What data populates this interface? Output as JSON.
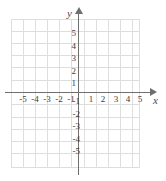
{
  "chart_data": {
    "type": "scatter",
    "title": "",
    "xlabel": "x",
    "ylabel": "y",
    "xlim": [
      -6,
      6
    ],
    "ylim": [
      -6,
      6
    ],
    "grid": true,
    "legend": null,
    "series": [],
    "x_ticks": [
      -5,
      -4,
      -3,
      -2,
      -1,
      1,
      2,
      3,
      4,
      5
    ],
    "y_ticks": [
      5,
      4,
      3,
      2,
      1,
      -1,
      -2,
      -3,
      -4,
      -5
    ],
    "x_tick_labels": [
      "-5",
      "-4",
      "-3",
      "-2",
      "-1",
      "1",
      "2",
      "3",
      "4",
      "5"
    ],
    "y_tick_labels": [
      "5",
      "4",
      "3",
      "2",
      "1",
      "-1",
      "-2",
      "-3",
      "-4",
      "-5"
    ],
    "annotations": [],
    "colors": {
      "background": "#ffffff",
      "grid": "#dedede",
      "axis": "#6f6f6f",
      "tick_text": "#3c3c3c",
      "axis_label_text": "#4a4a4a"
    }
  },
  "plane": {
    "axis_name_x": "x",
    "axis_name_y": "y",
    "x_labels": [
      {
        "text": "-5",
        "left": 16
      },
      {
        "text": "-4",
        "left": 28
      },
      {
        "text": "-3",
        "left": 40
      },
      {
        "text": "-2",
        "left": 52
      },
      {
        "text": "-1",
        "left": 64
      },
      {
        "text": "1",
        "left": 84
      },
      {
        "text": "2",
        "left": 96
      },
      {
        "text": "3",
        "left": 109
      },
      {
        "text": "4",
        "left": 121
      },
      {
        "text": "5",
        "left": 133
      }
    ],
    "y_labels": [
      {
        "text": "5",
        "left": 64,
        "top": 29
      },
      {
        "text": "4",
        "left": 64,
        "top": 42
      },
      {
        "text": "3",
        "left": 64,
        "top": 54
      },
      {
        "text": "2",
        "left": 64,
        "top": 67
      },
      {
        "text": "1",
        "left": 64,
        "top": 79
      },
      {
        "text": "-1",
        "left": 68,
        "top": 97
      },
      {
        "text": "-2",
        "left": 68,
        "top": 110
      },
      {
        "text": "-3",
        "left": 68,
        "top": 122
      },
      {
        "text": "-4",
        "left": 68,
        "top": 135
      },
      {
        "text": "-5",
        "left": 68,
        "top": 147
      }
    ],
    "grid_vertical_x": [
      0,
      12,
      24,
      36,
      48,
      60,
      73,
      85,
      97,
      109,
      121,
      128
    ],
    "grid_horizontal_y": [
      0,
      12,
      24,
      36,
      48,
      61,
      73,
      85,
      98,
      110,
      122,
      134,
      148
    ]
  }
}
